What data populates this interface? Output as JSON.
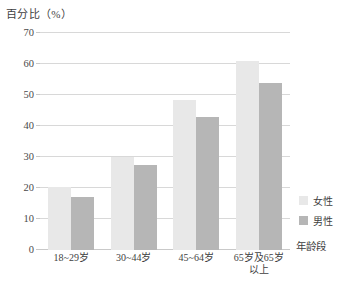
{
  "chart_data": {
    "type": "bar",
    "title": "",
    "ylabel": "百分比（%）",
    "xlabel": "年龄段",
    "categories": [
      "18~29岁",
      "30~44岁",
      "45~64岁",
      "65岁及65岁\n以上"
    ],
    "categories_display": [
      {
        "line1": "18~29岁",
        "line2": ""
      },
      {
        "line1": "30~44岁",
        "line2": ""
      },
      {
        "line1": "45~64岁",
        "line2": ""
      },
      {
        "line1": "65岁及65岁",
        "line2": "以上"
      }
    ],
    "series": [
      {
        "name": "女性",
        "color": "#e8e8e8",
        "values": [
          20.3,
          30.0,
          48.5,
          61.0
        ]
      },
      {
        "name": "男性",
        "color": "#b6b6b6",
        "values": [
          17.0,
          27.5,
          43.0,
          54.0
        ]
      }
    ],
    "ylim": [
      0,
      70
    ],
    "yticks": [
      0,
      10,
      20,
      30,
      40,
      50,
      60,
      70
    ],
    "ytick_labels": [
      "0",
      "10",
      "20",
      "30",
      "40",
      "50",
      "60",
      "70"
    ],
    "grid": true,
    "legend_position": "right-middle"
  },
  "legend": {
    "items": [
      {
        "label": "女性",
        "color": "#e8e8e8"
      },
      {
        "label": "男性",
        "color": "#b6b6b6"
      }
    ]
  }
}
